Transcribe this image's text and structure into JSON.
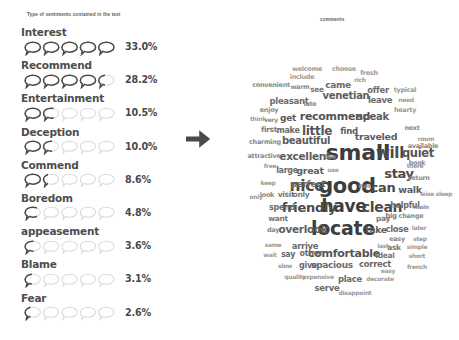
{
  "left": {
    "title": "Type of sentiments contained in the text",
    "max_percent": 33.0,
    "bubbles_per_row": 5,
    "colors": {
      "label": "#4d4d4d",
      "value": "#4a4a4a",
      "bubble_empty": "#d9d9d9",
      "bubble_fill": "#4a4a4a"
    },
    "items": [
      {
        "label": "Interest",
        "value": "33.0%",
        "percent": 33.0
      },
      {
        "label": "Recommend",
        "value": "28.2%",
        "percent": 28.2
      },
      {
        "label": "Entertainment",
        "value": "10.5%",
        "percent": 10.5
      },
      {
        "label": "Deception",
        "value": "10.0%",
        "percent": 10.0
      },
      {
        "label": "Commend",
        "value": "8.6%",
        "percent": 8.6
      },
      {
        "label": "Boredom",
        "value": "4.8%",
        "percent": 4.8
      },
      {
        "label": "appeasement",
        "value": "3.6%",
        "percent": 3.6
      },
      {
        "label": "Blame",
        "value": "3.1%",
        "percent": 3.1
      },
      {
        "label": "Fear",
        "value": "2.6%",
        "percent": 2.6
      }
    ]
  },
  "arrow": {
    "icon": "arrow-right-icon",
    "color": "#4a4a4a"
  },
  "right": {
    "title": "comments"
  },
  "chart_data": {
    "type": "wordcloud",
    "title": "comments",
    "xlabel": "",
    "ylabel": "",
    "grid": false,
    "legend": "none",
    "words": [
      {
        "text": "small",
        "size": 22,
        "x": 133,
        "y": 153,
        "color": "#3d3d3d"
      },
      {
        "text": "good",
        "size": 21,
        "x": 122,
        "y": 186,
        "color": "#3d3d3d"
      },
      {
        "text": "locate",
        "size": 19,
        "x": 118,
        "y": 228,
        "color": "#3d3d3d"
      },
      {
        "text": "have",
        "size": 17,
        "x": 119,
        "y": 206,
        "color": "#3d3d3d"
      },
      {
        "text": "nice",
        "size": 15.5,
        "x": 82,
        "y": 187,
        "color": "#4a4a4a"
      },
      {
        "text": "will",
        "size": 15,
        "x": 165,
        "y": 153,
        "color": "#4a4a4a"
      },
      {
        "text": "clean",
        "size": 14,
        "x": 157,
        "y": 207,
        "color": "#4a4a4a"
      },
      {
        "text": "friendly",
        "size": 13,
        "x": 84,
        "y": 207,
        "color": "#4a4a4a"
      },
      {
        "text": "comfortable",
        "size": 11,
        "x": 119,
        "y": 253,
        "color": "#545454"
      },
      {
        "text": "recommend",
        "size": 11,
        "x": 110,
        "y": 116,
        "color": "#545454"
      },
      {
        "text": "quiet",
        "size": 11.5,
        "x": 193,
        "y": 154,
        "color": "#545454"
      },
      {
        "text": "stay",
        "size": 13,
        "x": 174,
        "y": 173,
        "color": "#4a4a4a"
      },
      {
        "text": "can",
        "size": 13,
        "x": 158,
        "y": 187,
        "color": "#4a4a4a"
      },
      {
        "text": "little",
        "size": 12,
        "x": 92,
        "y": 131,
        "color": "#545454"
      },
      {
        "text": "excellent",
        "size": 10.5,
        "x": 80,
        "y": 156,
        "color": "#5d5d5d"
      },
      {
        "text": "beautiful",
        "size": 10,
        "x": 81,
        "y": 141,
        "color": "#5d5d5d"
      },
      {
        "text": "overlook",
        "size": 10.5,
        "x": 78,
        "y": 229,
        "color": "#5d5d5d"
      },
      {
        "text": "traveled",
        "size": 9.5,
        "x": 151,
        "y": 137,
        "color": "#5d5d5d"
      },
      {
        "text": "venetian",
        "size": 10,
        "x": 121,
        "y": 96,
        "color": "#5d5d5d"
      },
      {
        "text": "speak",
        "size": 10,
        "x": 148,
        "y": 117,
        "color": "#5d5d5d"
      },
      {
        "text": "spacious",
        "size": 9,
        "x": 107,
        "y": 265,
        "color": "#6b6b6b"
      },
      {
        "text": "correct",
        "size": 8.5,
        "x": 150,
        "y": 264,
        "color": "#6b6b6b"
      },
      {
        "text": "walk",
        "size": 9.5,
        "x": 185,
        "y": 190,
        "color": "#5d5d5d"
      },
      {
        "text": "take",
        "size": 9,
        "x": 151,
        "y": 230,
        "color": "#5d5d5d"
      },
      {
        "text": "great",
        "size": 9.5,
        "x": 85,
        "y": 171,
        "color": "#5d5d5d"
      },
      {
        "text": "perfect",
        "size": 9,
        "x": 83,
        "y": 184,
        "color": "#6b6b6b"
      },
      {
        "text": "arrive",
        "size": 8.5,
        "x": 80,
        "y": 246,
        "color": "#6b6b6b"
      },
      {
        "text": "place",
        "size": 8.5,
        "x": 125,
        "y": 279,
        "color": "#6b6b6b"
      },
      {
        "text": "serve",
        "size": 8.5,
        "x": 102,
        "y": 288,
        "color": "#6b6b6b"
      },
      {
        "text": "close",
        "size": 8.5,
        "x": 172,
        "y": 229,
        "color": "#6b6b6b"
      },
      {
        "text": "came",
        "size": 9,
        "x": 113,
        "y": 85,
        "color": "#6b6b6b"
      },
      {
        "text": "offer",
        "size": 8.5,
        "x": 153,
        "y": 90,
        "color": "#6b6b6b"
      },
      {
        "text": "leave",
        "size": 8.5,
        "x": 155,
        "y": 100,
        "color": "#6b6b6b"
      },
      {
        "text": "find",
        "size": 8.5,
        "x": 124,
        "y": 131,
        "color": "#5d5d5d"
      },
      {
        "text": "get",
        "size": 9,
        "x": 63,
        "y": 118,
        "color": "#5d5d5d"
      },
      {
        "text": "make",
        "size": 8,
        "x": 63,
        "y": 131,
        "color": "#6b6b6b"
      },
      {
        "text": "say",
        "size": 8,
        "x": 63,
        "y": 255,
        "color": "#6b6b6b"
      },
      {
        "text": "other",
        "size": 8,
        "x": 86,
        "y": 254,
        "color": "#6b6b6b"
      },
      {
        "text": "give",
        "size": 8,
        "x": 83,
        "y": 266,
        "color": "#6b6b6b"
      },
      {
        "text": "helpful",
        "size": 8,
        "x": 180,
        "y": 206,
        "color": "#6b6b6b"
      },
      {
        "text": "large",
        "size": 8,
        "x": 62,
        "y": 171,
        "color": "#6b6b6b"
      },
      {
        "text": "visit",
        "size": 7.5,
        "x": 61,
        "y": 195,
        "color": "#777777"
      },
      {
        "text": "only",
        "size": 7.5,
        "x": 76,
        "y": 195,
        "color": "#777777"
      },
      {
        "text": "spend",
        "size": 8,
        "x": 57,
        "y": 208,
        "color": "#6b6b6b"
      },
      {
        "text": "want",
        "size": 7.5,
        "x": 53,
        "y": 219,
        "color": "#777777"
      },
      {
        "text": "first",
        "size": 7.5,
        "x": 44,
        "y": 130,
        "color": "#777777"
      },
      {
        "text": "pleasant",
        "size": 8.5,
        "x": 64,
        "y": 101,
        "color": "#6b6b6b"
      },
      {
        "text": "charming",
        "size": 6.5,
        "x": 40,
        "y": 142,
        "color": "#8a8a8a"
      },
      {
        "text": "attractive",
        "size": 6.5,
        "x": 39,
        "y": 156,
        "color": "#8a8a8a"
      },
      {
        "text": "convenient",
        "size": 6.5,
        "x": 46,
        "y": 85,
        "color": "#8a8a8a"
      },
      {
        "text": "welcome",
        "size": 6.5,
        "x": 82,
        "y": 69,
        "color": "#9a9a9a"
      },
      {
        "text": "include",
        "size": 6.5,
        "x": 77,
        "y": 77,
        "color": "#9a9a9a"
      },
      {
        "text": "choose",
        "size": 6.5,
        "x": 119,
        "y": 69,
        "color": "#9a9a9a"
      },
      {
        "text": "fresh",
        "size": 6.5,
        "x": 144,
        "y": 73,
        "color": "#9a9a9a"
      },
      {
        "text": "rich",
        "size": 6,
        "x": 135,
        "y": 80,
        "color": "#9a9a9a"
      },
      {
        "text": "warm",
        "size": 6.5,
        "x": 75,
        "y": 87,
        "color": "#8a8a8a"
      },
      {
        "text": "see",
        "size": 7.5,
        "x": 92,
        "y": 90,
        "color": "#777777"
      },
      {
        "text": "late",
        "size": 6.5,
        "x": 85,
        "y": 104,
        "color": "#8a8a8a"
      },
      {
        "text": "enjoy",
        "size": 6.5,
        "x": 44,
        "y": 110,
        "color": "#8a8a8a"
      },
      {
        "text": "think",
        "size": 6,
        "x": 33,
        "y": 119,
        "color": "#9a9a9a"
      },
      {
        "text": "very",
        "size": 6,
        "x": 46,
        "y": 120,
        "color": "#8a8a8a"
      },
      {
        "text": "typical",
        "size": 6.5,
        "x": 180,
        "y": 90,
        "color": "#9a9a9a"
      },
      {
        "text": "need",
        "size": 6,
        "x": 181,
        "y": 100,
        "color": "#9a9a9a"
      },
      {
        "text": "hearty",
        "size": 6.5,
        "x": 180,
        "y": 110,
        "color": "#9a9a9a"
      },
      {
        "text": "next",
        "size": 6.5,
        "x": 187,
        "y": 128,
        "color": "#8a8a8a"
      },
      {
        "text": "room",
        "size": 6,
        "x": 201,
        "y": 139,
        "color": "#9a9a9a"
      },
      {
        "text": "available",
        "size": 6.5,
        "x": 198,
        "y": 146,
        "color": "#8a8a8a"
      },
      {
        "text": "book",
        "size": 6.5,
        "x": 192,
        "y": 163,
        "color": "#8a8a8a"
      },
      {
        "text": "there",
        "size": 6,
        "x": 190,
        "y": 166,
        "color": "#9a9a9a"
      },
      {
        "text": "return",
        "size": 6.5,
        "x": 194,
        "y": 178,
        "color": "#8a8a8a"
      },
      {
        "text": "wise",
        "size": 6,
        "x": 202,
        "y": 194,
        "color": "#9a9a9a"
      },
      {
        "text": "sleep",
        "size": 6,
        "x": 219,
        "y": 194,
        "color": "#9a9a9a"
      },
      {
        "text": "main",
        "size": 6,
        "x": 196,
        "y": 207,
        "color": "#8a8a8a"
      },
      {
        "text": "big",
        "size": 7,
        "x": 166,
        "y": 216,
        "color": "#7d7d7d"
      },
      {
        "text": "change",
        "size": 6.5,
        "x": 186,
        "y": 216,
        "color": "#8a8a8a"
      },
      {
        "text": "pay",
        "size": 7.5,
        "x": 158,
        "y": 219,
        "color": "#777777"
      },
      {
        "text": "easy",
        "size": 6.5,
        "x": 172,
        "y": 239,
        "color": "#8a8a8a"
      },
      {
        "text": "later",
        "size": 6,
        "x": 194,
        "y": 228,
        "color": "#9a9a9a"
      },
      {
        "text": "step",
        "size": 6,
        "x": 195,
        "y": 239,
        "color": "#9a9a9a"
      },
      {
        "text": "ask",
        "size": 7.5,
        "x": 169,
        "y": 248,
        "color": "#777777"
      },
      {
        "text": "last",
        "size": 6,
        "x": 158,
        "y": 246,
        "color": "#9a9a9a"
      },
      {
        "text": "simple",
        "size": 6,
        "x": 192,
        "y": 247,
        "color": "#9a9a9a"
      },
      {
        "text": "ideal",
        "size": 7.5,
        "x": 160,
        "y": 256,
        "color": "#777777"
      },
      {
        "text": "short",
        "size": 6,
        "x": 192,
        "y": 256,
        "color": "#9a9a9a"
      },
      {
        "text": "easy",
        "size": 6,
        "x": 163,
        "y": 271,
        "color": "#9a9a9a"
      },
      {
        "text": "french",
        "size": 6,
        "x": 192,
        "y": 267,
        "color": "#9a9a9a"
      },
      {
        "text": "decorate",
        "size": 6,
        "x": 155,
        "y": 279,
        "color": "#9a9a9a"
      },
      {
        "text": "disappoint",
        "size": 6,
        "x": 130,
        "y": 293,
        "color": "#9a9a9a"
      },
      {
        "text": "quality",
        "size": 6,
        "x": 70,
        "y": 277,
        "color": "#9a9a9a"
      },
      {
        "text": "expensive",
        "size": 6,
        "x": 93,
        "y": 277,
        "color": "#9a9a9a"
      },
      {
        "text": "slow",
        "size": 6,
        "x": 60,
        "y": 266,
        "color": "#9a9a9a"
      },
      {
        "text": "wait",
        "size": 6,
        "x": 45,
        "y": 255,
        "color": "#9a9a9a"
      },
      {
        "text": "same",
        "size": 6,
        "x": 48,
        "y": 245,
        "color": "#9a9a9a"
      },
      {
        "text": "day",
        "size": 6.5,
        "x": 48,
        "y": 230,
        "color": "#8a8a8a"
      },
      {
        "text": "look",
        "size": 6.5,
        "x": 42,
        "y": 195,
        "color": "#8a8a8a"
      },
      {
        "text": "keep",
        "size": 6,
        "x": 43,
        "y": 183,
        "color": "#9a9a9a"
      },
      {
        "text": "free",
        "size": 6,
        "x": 45,
        "y": 166,
        "color": "#9a9a9a"
      },
      {
        "text": "use",
        "size": 6,
        "x": 108,
        "y": 170,
        "color": "#9a9a9a"
      },
      {
        "text": "run",
        "size": 6.5,
        "x": 139,
        "y": 186,
        "color": "#8a8a8a"
      },
      {
        "text": "too",
        "size": 6.5,
        "x": 105,
        "y": 157,
        "color": "#8a8a8a"
      },
      {
        "text": "only",
        "size": 6,
        "x": 31,
        "y": 197,
        "color": "#9a9a9a"
      }
    ]
  }
}
